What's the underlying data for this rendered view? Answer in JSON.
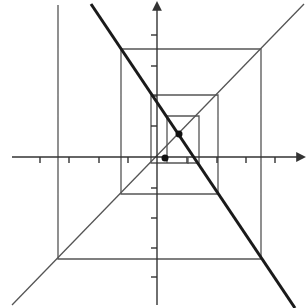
{
  "diagram": {
    "colors": {
      "background": "#ffffff",
      "thin_line": "#555555",
      "axis": "#333333",
      "thick_line": "#1a1a1a",
      "point": "#111111"
    },
    "axes": {
      "origin": [
        157,
        157
      ],
      "x_axis": {
        "from": [
          12,
          157
        ],
        "to": [
          304,
          157
        ],
        "arrow": "right"
      },
      "y_axis": {
        "from": [
          157,
          305
        ],
        "to": [
          157,
          3
        ],
        "arrow": "up"
      },
      "x_ticks": [
        40,
        69,
        99,
        128,
        187,
        217,
        246,
        275
      ],
      "y_ticks": [
        35,
        66,
        96,
        126,
        188,
        218,
        248,
        277
      ]
    },
    "lines": {
      "diagonal_thin": {
        "from": [
          12,
          305
        ],
        "to": [
          304,
          4
        ]
      },
      "thick_line": {
        "from": [
          91,
          4
        ],
        "to": [
          295,
          308
        ]
      }
    },
    "spiral_path": [
      [
        58,
        5
      ],
      [
        58,
        259
      ],
      [
        261,
        259
      ],
      [
        261,
        49
      ],
      [
        121,
        49
      ],
      [
        121,
        194
      ],
      [
        218,
        194
      ],
      [
        218,
        95
      ],
      [
        151,
        95
      ],
      [
        151,
        163
      ],
      [
        199,
        163
      ],
      [
        199,
        116
      ],
      [
        167,
        116
      ],
      [
        167,
        163
      ]
    ],
    "extra_segments": [
      {
        "from": [
          188,
          157
        ],
        "to": [
          188,
          164
        ]
      }
    ],
    "points": [
      {
        "name": "intersection-point",
        "x": 179,
        "y": 134,
        "r": 3.5
      },
      {
        "name": "start-point",
        "x": 165,
        "y": 158,
        "r": 3.5
      }
    ]
  }
}
